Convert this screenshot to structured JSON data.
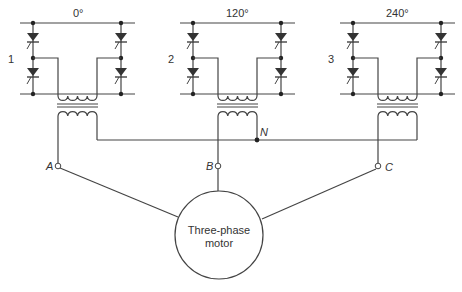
{
  "diagram": {
    "sections": [
      {
        "number": "1",
        "phase": "0°",
        "x": 0
      },
      {
        "number": "2",
        "phase": "120°",
        "x": 150
      },
      {
        "number": "3",
        "phase": "240°",
        "x": 320
      }
    ],
    "neutral_label": "N",
    "terminals": [
      {
        "label": "A"
      },
      {
        "label": "B"
      },
      {
        "label": "C"
      }
    ],
    "motor": {
      "line1": "Three-phase",
      "line2": "motor"
    },
    "colors": {
      "line": "#444444",
      "background": "#ffffff"
    }
  }
}
